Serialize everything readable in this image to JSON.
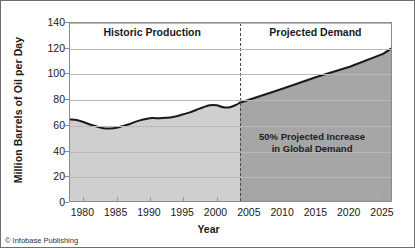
{
  "credit": "© Infobase Publishing",
  "chart_data": {
    "type": "area",
    "title": "",
    "xlabel": "Year",
    "ylabel": "Million Barrels of Oil per Day",
    "xlim": [
      1978,
      2026.5
    ],
    "ylim": [
      0,
      140
    ],
    "grid": true,
    "legend_position": "none",
    "yticks": [
      0,
      20,
      40,
      60,
      80,
      100,
      120,
      140
    ],
    "ytick_labels": [
      "0",
      "20",
      "40",
      "60",
      "80",
      "100",
      "120",
      "140"
    ],
    "xticks": [
      1980,
      1985,
      1990,
      1995,
      2000,
      2005,
      2010,
      2015,
      2020,
      2025
    ],
    "xtick_labels": [
      "1980",
      "1985",
      "1990",
      "1995",
      "2000",
      "2005",
      "2010",
      "2015",
      "2020",
      "2025"
    ],
    "divider_x": 2003.5,
    "annotations": [
      {
        "name": "historic-title",
        "text": "Historic Production",
        "x": 1990.5,
        "y": 132
      },
      {
        "name": "projected-title",
        "text": "Projected Demand",
        "x": 2015.0,
        "y": 132
      },
      {
        "name": "annotation",
        "line1": "50% Projected Increase",
        "line2": "in Global Demand",
        "x": 2014.5,
        "y": 46
      }
    ],
    "colors": {
      "historic_fill": "#cfcfcf",
      "projected_fill": "#a6a6a6",
      "line": "#1a1a1a",
      "grid": "#b9b9b9",
      "divider": "#4a4a4a",
      "frame": "#6f6f6f",
      "background": "#ffffff"
    },
    "series": [
      {
        "name": "Historic Production",
        "x": [
          1978,
          1979,
          1980,
          1981,
          1982,
          1983,
          1984,
          1985,
          1986,
          1987,
          1988,
          1989,
          1990,
          1991,
          1992,
          1993,
          1994,
          1995,
          1996,
          1997,
          1998,
          1999,
          2000,
          2001,
          2002,
          2003,
          2003.5
        ],
        "values": [
          65,
          64.5,
          63,
          61,
          59.5,
          58.2,
          58,
          58.5,
          60,
          61.5,
          63.5,
          65,
          66,
          66,
          66.2,
          66.5,
          67.5,
          69,
          70.5,
          72.5,
          74.5,
          76,
          76,
          74.5,
          74.5,
          76.5,
          78
        ]
      },
      {
        "name": "Projected Demand",
        "x": [
          2003.5,
          2005,
          2010,
          2015,
          2020,
          2025,
          2026.2
        ],
        "values": [
          78,
          80.5,
          89,
          98,
          106,
          116,
          120
        ]
      }
    ]
  }
}
